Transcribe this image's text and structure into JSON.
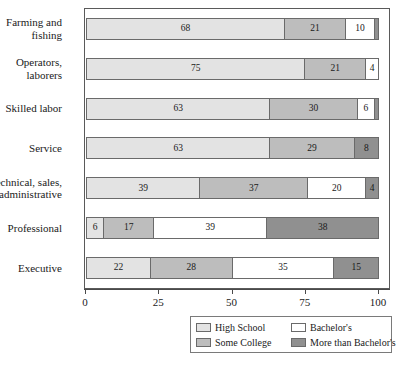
{
  "chart_data": {
    "type": "bar",
    "orientation": "horizontal",
    "stacked": true,
    "title": "",
    "subtitle": "",
    "xlabel": "",
    "ylabel": "",
    "xlim": [
      0,
      100
    ],
    "xticks": [
      0,
      25,
      50,
      75,
      100
    ],
    "xtick_labels": [
      "0",
      "25",
      "50",
      "75",
      "100"
    ],
    "grid": false,
    "legend_position": "bottom-right",
    "categories": [
      "Farming and fishing",
      "Operators, laborers",
      "Skilled labor",
      "Service",
      "Technical, sales, administrative",
      "Professional",
      "Executive"
    ],
    "series": [
      {
        "name": "High School",
        "color": "#e3e3e3",
        "values": [
          68,
          75,
          63,
          63,
          39,
          6,
          22
        ]
      },
      {
        "name": "Some College",
        "color": "#bdbdbd",
        "values": [
          21,
          21,
          30,
          29,
          37,
          17,
          28
        ]
      },
      {
        "name": "Bachelor's",
        "color": "#ffffff",
        "values": [
          10,
          4,
          6,
          0,
          20,
          39,
          35
        ]
      },
      {
        "name": "More than Bachelor's",
        "color": "#909090",
        "values": [
          1,
          0,
          1,
          8,
          4,
          38,
          15
        ]
      }
    ]
  },
  "axis": {
    "ticks": [
      {
        "value": 0,
        "label": "0"
      },
      {
        "value": 25,
        "label": "25"
      },
      {
        "value": 50,
        "label": "50"
      },
      {
        "value": 75,
        "label": "75"
      },
      {
        "value": 100,
        "label": "100"
      }
    ]
  },
  "rows": [
    {
      "label_line1": "Farming and",
      "label_line2": "fishing",
      "segments": [
        {
          "series": "High School",
          "value": 68,
          "label": "68",
          "show_label": true
        },
        {
          "series": "Some College",
          "value": 21,
          "label": "21",
          "show_label": true
        },
        {
          "series": "Bachelor's",
          "value": 10,
          "label": "10",
          "show_label": true
        },
        {
          "series": "More than Bachelor's",
          "value": 1,
          "label": "1",
          "show_label": false
        }
      ]
    },
    {
      "label_line1": "Operators,",
      "label_line2": "laborers",
      "segments": [
        {
          "series": "High School",
          "value": 75,
          "label": "75",
          "show_label": true
        },
        {
          "series": "Some College",
          "value": 21,
          "label": "21",
          "show_label": true
        },
        {
          "series": "Bachelor's",
          "value": 4,
          "label": "4",
          "show_label": true
        }
      ]
    },
    {
      "label_line1": "Skilled labor",
      "label_line2": "",
      "segments": [
        {
          "series": "High School",
          "value": 63,
          "label": "63",
          "show_label": true
        },
        {
          "series": "Some College",
          "value": 30,
          "label": "30",
          "show_label": true
        },
        {
          "series": "Bachelor's",
          "value": 6,
          "label": "6",
          "show_label": true
        },
        {
          "series": "More than Bachelor's",
          "value": 1,
          "label": "1",
          "show_label": false
        }
      ]
    },
    {
      "label_line1": "Service",
      "label_line2": "",
      "segments": [
        {
          "series": "High School",
          "value": 63,
          "label": "63",
          "show_label": true
        },
        {
          "series": "Some College",
          "value": 29,
          "label": "29",
          "show_label": true
        },
        {
          "series": "More than Bachelor's",
          "value": 8,
          "label": "8",
          "show_label": true
        }
      ]
    },
    {
      "label_line1": "Technical, sales,",
      "label_line2": "administrative",
      "segments": [
        {
          "series": "High School",
          "value": 39,
          "label": "39",
          "show_label": true
        },
        {
          "series": "Some College",
          "value": 37,
          "label": "37",
          "show_label": true
        },
        {
          "series": "Bachelor's",
          "value": 20,
          "label": "20",
          "show_label": true
        },
        {
          "series": "More than Bachelor's",
          "value": 4,
          "label": "4",
          "show_label": true
        }
      ]
    },
    {
      "label_line1": "Professional",
      "label_line2": "",
      "segments": [
        {
          "series": "High School",
          "value": 6,
          "label": "6",
          "show_label": true
        },
        {
          "series": "Some College",
          "value": 17,
          "label": "17",
          "show_label": true
        },
        {
          "series": "Bachelor's",
          "value": 39,
          "label": "39",
          "show_label": true
        },
        {
          "series": "More than Bachelor's",
          "value": 38,
          "label": "38",
          "show_label": true
        }
      ]
    },
    {
      "label_line1": "Executive",
      "label_line2": "",
      "segments": [
        {
          "series": "High School",
          "value": 22,
          "label": "22",
          "show_label": true
        },
        {
          "series": "Some College",
          "value": 28,
          "label": "28",
          "show_label": true
        },
        {
          "series": "Bachelor's",
          "value": 35,
          "label": "35",
          "show_label": true
        },
        {
          "series": "More than Bachelor's",
          "value": 15,
          "label": "15",
          "show_label": true
        }
      ]
    }
  ],
  "legend": {
    "entries": [
      {
        "label": "High School",
        "key": "hs",
        "color": "#e3e3e3"
      },
      {
        "label": "Bachelor's",
        "key": "ba",
        "color": "#ffffff"
      },
      {
        "label": "Some College",
        "key": "sc",
        "color": "#bdbdbd"
      },
      {
        "label": "More than Bachelor's",
        "key": "mba",
        "color": "#909090"
      }
    ]
  },
  "colors": {
    "high_school": "#e3e3e3",
    "some_college": "#bdbdbd",
    "bachelors": "#ffffff",
    "more_than_bachelors": "#909090",
    "frame": "#5a5a5a",
    "text": "#1a1a1a"
  }
}
